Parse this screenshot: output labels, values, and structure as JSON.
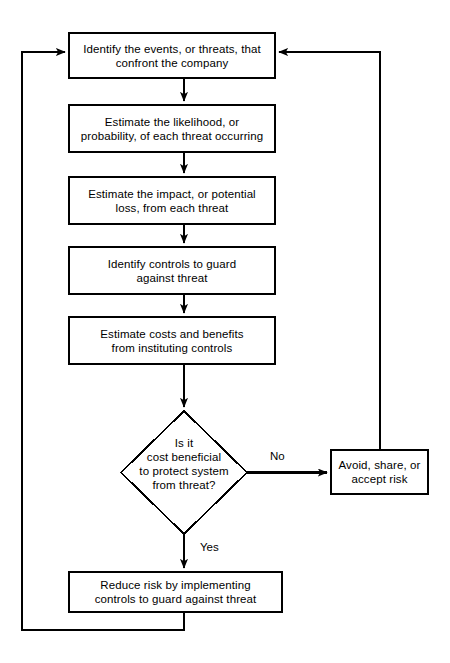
{
  "diagram": {
    "type": "flowchart",
    "background_color": "#ffffff",
    "stroke_color": "#000000",
    "text_color": "#000000",
    "nodes": [
      {
        "id": "identify-events",
        "shape": "process",
        "text": "Identify the events, or threats, that\nconfront the company",
        "x": 69,
        "y": 33,
        "w": 206,
        "h": 45
      },
      {
        "id": "estimate-likelihood",
        "shape": "process",
        "text": "Estimate the likelihood, or\nprobability, of each threat occurring",
        "x": 69,
        "y": 105,
        "w": 206,
        "h": 47
      },
      {
        "id": "estimate-impact",
        "shape": "process",
        "text": "Estimate the impact, or potential\nloss, from each threat",
        "x": 69,
        "y": 177,
        "w": 206,
        "h": 47
      },
      {
        "id": "identify-controls",
        "shape": "process",
        "text": "Identify controls to guard\nagainst threat",
        "x": 69,
        "y": 247,
        "w": 206,
        "h": 47
      },
      {
        "id": "estimate-costs-benefits",
        "shape": "process",
        "text": "Estimate costs and benefits\nfrom instituting controls",
        "x": 69,
        "y": 317,
        "w": 206,
        "h": 47
      },
      {
        "id": "cost-beneficial-decision",
        "shape": "decision",
        "text": "Is it\ncost beneficial\nto protect system\nfrom threat?",
        "x": 121,
        "y": 411,
        "w": 126,
        "h": 123
      },
      {
        "id": "avoid-share-accept",
        "shape": "process",
        "text": "Avoid, share, or\naccept risk",
        "x": 331,
        "y": 450,
        "w": 97,
        "h": 44
      },
      {
        "id": "reduce-risk",
        "shape": "process",
        "text": "Reduce risk by implementing\ncontrols to guard against threat",
        "x": 69,
        "y": 572,
        "w": 213,
        "h": 40
      }
    ],
    "edge_labels": [
      {
        "id": "no-branch-label",
        "text": "No",
        "x": 270,
        "y": 450
      },
      {
        "id": "yes-branch-label",
        "text": "Yes",
        "x": 200,
        "y": 541
      }
    ]
  }
}
